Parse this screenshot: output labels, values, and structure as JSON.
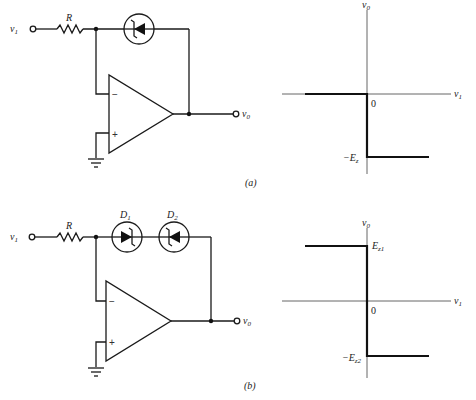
{
  "figure_a": {
    "caption": "(a)",
    "circuit": {
      "input_label": "v",
      "input_sub": "1",
      "resistor_label": "R",
      "output_label": "v",
      "output_sub": "0",
      "inverting_sign": "−",
      "noninverting_sign": "+",
      "feedback": "single zener diode"
    },
    "graph": {
      "y_axis_label": "v",
      "y_axis_sub": "0",
      "x_axis_label": "v",
      "x_axis_sub": "1",
      "origin_label": "0",
      "low_level_label": "−E",
      "low_level_sub": "z",
      "transfer": [
        [
          -1,
          0
        ],
        [
          0,
          0
        ],
        [
          0,
          -1
        ],
        [
          1,
          -1
        ]
      ]
    }
  },
  "figure_b": {
    "caption": "(b)",
    "circuit": {
      "input_label": "v",
      "input_sub": "1",
      "resistor_label": "R",
      "diode1_label": "D",
      "diode1_sub": "1",
      "diode2_label": "D",
      "diode2_sub": "2",
      "output_label": "v",
      "output_sub": "0",
      "inverting_sign": "−",
      "noninverting_sign": "+",
      "feedback": "two back-to-back zener diodes"
    },
    "graph": {
      "y_axis_label": "v",
      "y_axis_sub": "0",
      "x_axis_label": "v",
      "x_axis_sub": "1",
      "origin_label": "0",
      "high_level_label": "E",
      "high_level_sub": "z1",
      "low_level_label": "−E",
      "low_level_sub": "z2",
      "transfer": [
        [
          -1,
          1
        ],
        [
          0,
          1
        ],
        [
          0,
          -1
        ],
        [
          1,
          -1
        ]
      ]
    }
  }
}
